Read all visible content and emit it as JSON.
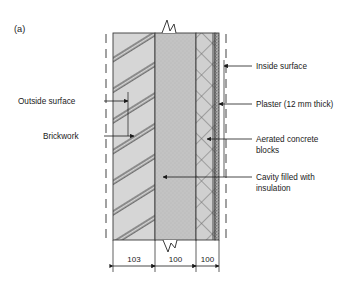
{
  "figure": {
    "panel_label": "(a)",
    "caption_labels": {
      "outside_surface": "Outside surface",
      "brickwork": "Brickwork",
      "inside_surface": "Inside surface",
      "plaster": "Plaster (12 mm thick)",
      "aerated_blocks_line1": "Aerated concrete",
      "aerated_blocks_line2": "blocks",
      "cavity_line1": "Cavity filled with",
      "cavity_line2": "insulation"
    },
    "dimensions": {
      "brickwork": "103",
      "cavity": "100",
      "blocks": "100",
      "unit_note": "12 mm thick"
    },
    "colors": {
      "brickwork_fill": "#d4d4d4",
      "cavity_fill": "#c2c2c2",
      "blocks_fill": "#cfcfcf",
      "plaster_fill": "#9a9a9a",
      "hatch_stroke": "#5a5a5a",
      "outline": "#3a3a3a",
      "text": "#1a1a1a",
      "background": "#ffffff"
    },
    "layers": [
      {
        "name": "Brickwork",
        "thickness": "103",
        "hatch": "double-diagonal"
      },
      {
        "name": "Cavity filled with insulation",
        "thickness": "100",
        "hatch": "stipple"
      },
      {
        "name": "Aerated concrete blocks",
        "thickness": "100",
        "hatch": "cross-diamond"
      },
      {
        "name": "Plaster (12 mm thick)",
        "thickness": "12",
        "hatch": "dotted"
      }
    ]
  }
}
